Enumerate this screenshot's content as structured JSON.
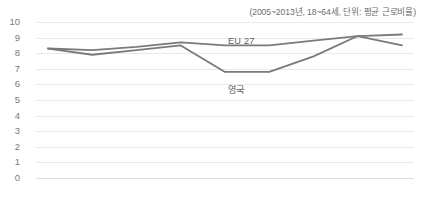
{
  "chart_title": "",
  "subtitle": "(2005~2013년, 18~64세, 단위: 평균 근로비율)",
  "axis": {
    "yticks": [
      "10",
      "9",
      "8",
      "7",
      "6",
      "5",
      "4",
      "3",
      "2",
      "1",
      "0"
    ],
    "xticks": [
      "2005",
      "2006",
      "2007",
      "2008",
      "2009",
      "2010",
      "2011",
      "2012",
      "2013"
    ]
  },
  "labels": {
    "eu": "EU 27",
    "uk": "영국"
  },
  "colors": {
    "line": "#7a7a7a",
    "grid": "#e9e9e9",
    "tick_text": "#7a7a7a",
    "subtitle_text": "#6d6d6d"
  },
  "chart_data": {
    "type": "line",
    "title": "",
    "subtitle": "(2005~2013년, 18~64세, 단위: 평균 근로비율)",
    "xlabel": "",
    "ylabel": "",
    "categories": [
      "2005",
      "2006",
      "2007",
      "2008",
      "2009",
      "2010",
      "2011",
      "2012",
      "2013"
    ],
    "ylim": [
      0,
      10
    ],
    "ytick_step": 1,
    "grid": true,
    "legend": "inline-annotations",
    "series": [
      {
        "name": "EU 27",
        "color": "#7a7a7a",
        "values": [
          8.3,
          8.2,
          8.4,
          8.7,
          8.5,
          8.5,
          8.8,
          9.1,
          9.2
        ]
      },
      {
        "name": "영국",
        "color": "#7a7a7a",
        "values": [
          8.3,
          7.9,
          8.2,
          8.5,
          6.8,
          6.8,
          7.8,
          9.1,
          8.5
        ]
      }
    ]
  }
}
